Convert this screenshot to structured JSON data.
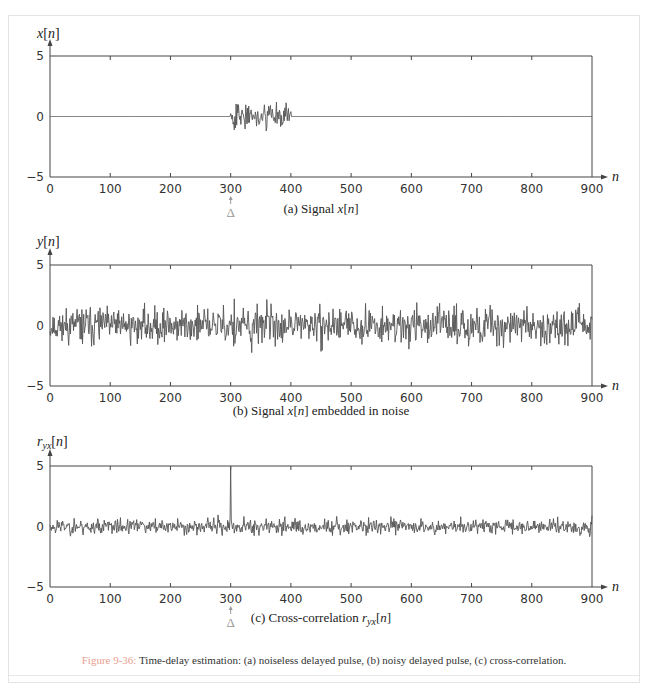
{
  "figure": {
    "label": "Figure 9-36:",
    "caption": " Time-delay estimation: (a) noiseless delayed pulse, (b) noisy delayed pulse, (c) cross-correlation.",
    "label_color": "#e8a090",
    "line_color": "#555555"
  },
  "chart_data": [
    {
      "type": "line",
      "id": "a",
      "ylabel": "x[n]",
      "xlabel": "n",
      "subtitle": "(a) Signal x[n]",
      "x_ticks": [
        0,
        100,
        200,
        300,
        400,
        500,
        600,
        700,
        800,
        900
      ],
      "y_ticks": [
        -5,
        0,
        5
      ],
      "xlim": [
        0,
        900
      ],
      "ylim": [
        -5,
        5
      ],
      "annotation": {
        "text": "Δ",
        "x": 300
      },
      "description": "Zero everywhere except a random pulse for 300 ≤ n ≤ 400 with amplitude roughly between -2.5 and 3",
      "pulse": {
        "start": 300,
        "end": 400,
        "max": 3.0,
        "min": -2.5
      },
      "noise_std": 0,
      "seed": 7
    },
    {
      "type": "line",
      "id": "b",
      "ylabel": "y[n]",
      "xlabel": "n",
      "subtitle": "(b) Signal x[n] embedded in noise",
      "x_ticks": [
        0,
        100,
        200,
        300,
        400,
        500,
        600,
        700,
        800,
        900
      ],
      "y_ticks": [
        -5,
        0,
        5
      ],
      "xlim": [
        0,
        900
      ],
      "ylim": [
        -5,
        5
      ],
      "description": "Noise of std ≈ 1 across full range, peaks near +3.8 (n≈60, n≈380) and -3.5 (n≈250)",
      "pulse": {
        "start": 300,
        "end": 400,
        "max": 3.0,
        "min": -2.5
      },
      "noise_std": 1.0,
      "seed": 11
    },
    {
      "type": "line",
      "id": "c",
      "ylabel": "r_yx[n]",
      "xlabel": "n",
      "subtitle": "(c) Cross-correlation r_yx[n]",
      "x_ticks": [
        0,
        100,
        200,
        300,
        400,
        500,
        600,
        700,
        800,
        900
      ],
      "y_ticks": [
        -5,
        0,
        5
      ],
      "xlim": [
        0,
        900
      ],
      "ylim": [
        -5,
        5
      ],
      "annotation": {
        "text": "Δ",
        "x": 300
      },
      "description": "Low-level noise (≈ ±1) with a single sharp peak of ≈5 at n=300",
      "peak": {
        "x": 300,
        "y": 5.0
      },
      "noise_std": 0.45,
      "seed": 23
    }
  ]
}
